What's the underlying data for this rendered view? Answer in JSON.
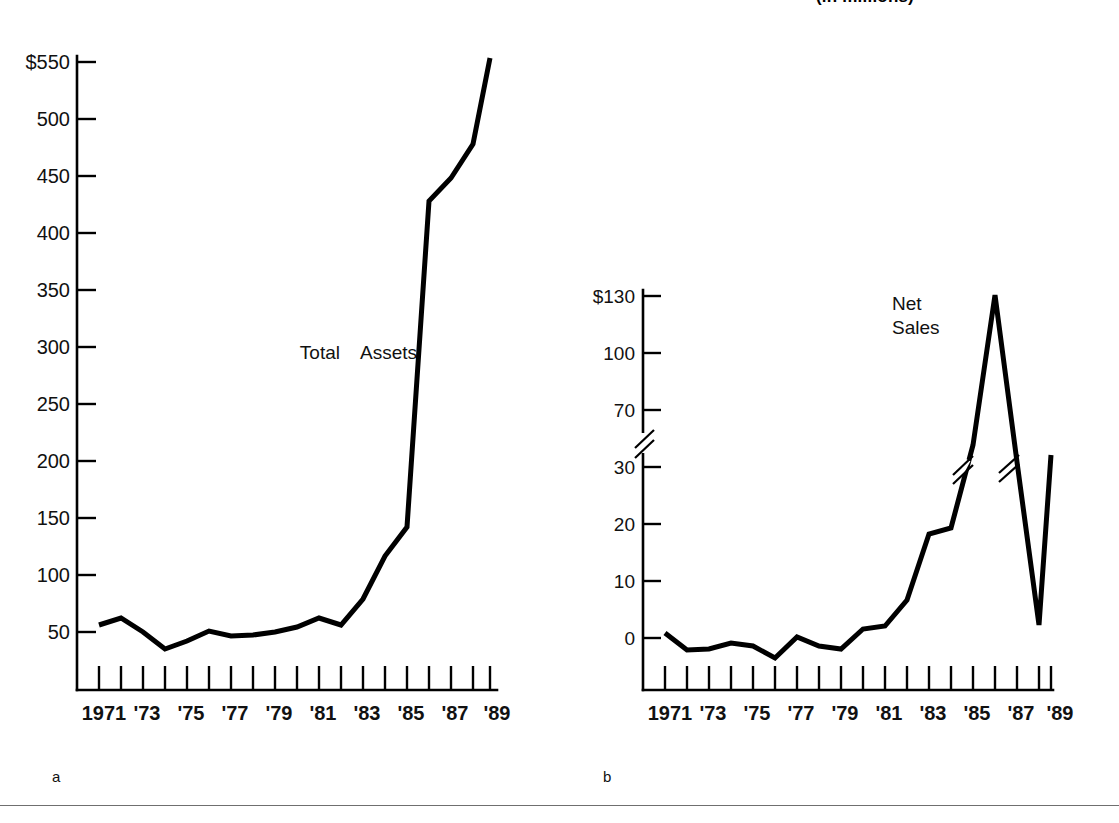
{
  "figure": {
    "title_sliver": "(in millions)",
    "panel_a_label": "a",
    "panel_b_label": "b"
  },
  "chart_data": [
    {
      "panel": "a",
      "type": "line",
      "title": "",
      "series_label": "Total Assets",
      "xlabel": "",
      "ylabel": "",
      "grid": false,
      "legend_position": "inline-annotation",
      "x": [
        1971,
        1972,
        1973,
        1974,
        1975,
        1976,
        1977,
        1978,
        1979,
        1980,
        1981,
        1982,
        1983,
        1984,
        1985,
        1986,
        1987,
        1988,
        1989
      ],
      "xtick_labels": [
        "1971",
        "'73",
        "'75",
        "'77",
        "'79",
        "'81",
        "'83",
        "'85",
        "'87",
        "'89"
      ],
      "xtick_years": [
        1971,
        1973,
        1975,
        1977,
        1979,
        1981,
        1983,
        1985,
        1987,
        1989
      ],
      "ytick_labels": [
        "$550",
        "500",
        "450",
        "400",
        "350",
        "300",
        "250",
        "200",
        "150",
        "100",
        "50"
      ],
      "ytick_values": [
        550,
        500,
        450,
        400,
        350,
        300,
        250,
        200,
        150,
        100,
        50
      ],
      "ylim": [
        0,
        570
      ],
      "values": [
        56,
        62,
        50,
        35,
        42,
        51,
        47,
        48,
        50,
        55,
        63,
        57,
        80,
        118,
        143,
        428,
        448,
        478,
        550
      ],
      "units_note": "Total Assets"
    },
    {
      "panel": "b",
      "type": "line",
      "title": "",
      "series_label": "Net Sales",
      "xlabel": "",
      "ylabel": "",
      "grid": false,
      "legend_position": "inline-annotation",
      "axis_break": {
        "below": 30,
        "above": 70,
        "style": "zigzag"
      },
      "x": [
        1971,
        1972,
        1973,
        1974,
        1975,
        1976,
        1977,
        1978,
        1979,
        1980,
        1981,
        1982,
        1983,
        1984,
        1985,
        1986,
        1987,
        1988,
        1989
      ],
      "xtick_labels": [
        "1971",
        "'73",
        "'75",
        "'77",
        "'79",
        "'81",
        "'83",
        "'85",
        "'87",
        "'89"
      ],
      "xtick_years": [
        1971,
        1973,
        1975,
        1977,
        1979,
        1981,
        1983,
        1985,
        1987,
        1989
      ],
      "ytick_labels": [
        "$130",
        "100",
        "70",
        "30",
        "20",
        "10",
        "0"
      ],
      "ytick_values": [
        130,
        100,
        70,
        30,
        20,
        10,
        0
      ],
      "ylim": [
        -5,
        140
      ],
      "values": [
        1,
        -2,
        -2,
        -1,
        0,
        -1,
        -3,
        1,
        0,
        -2,
        2,
        3,
        8,
        25,
        26,
        60,
        140,
        3,
        31
      ],
      "units_note": "Net Sales"
    }
  ]
}
